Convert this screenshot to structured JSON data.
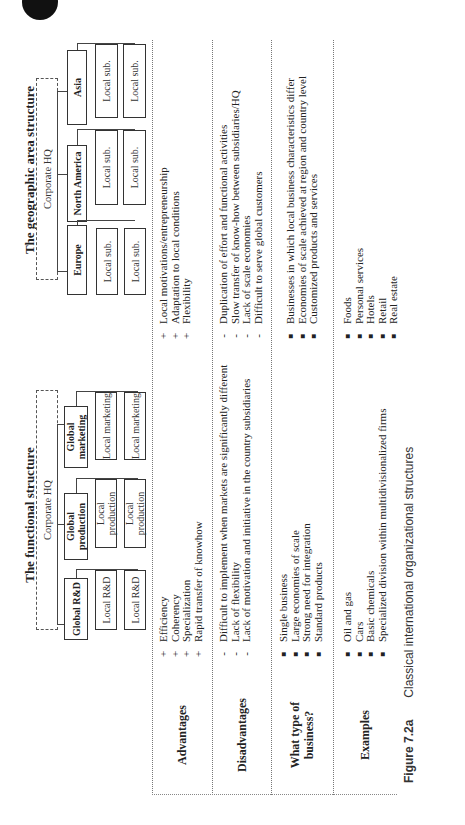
{
  "functional": {
    "title": "The functional structure",
    "hq": "Corporate HQ",
    "global_units": [
      "Global R&D",
      "Global production",
      "Global marketing"
    ],
    "local_units": [
      [
        "Local R&D",
        "Local R&D"
      ],
      [
        "Local production",
        "Local production"
      ],
      [
        "Local marketing",
        "Local marketing"
      ]
    ]
  },
  "geographic": {
    "title": "The geographic area structure",
    "hq": "Corporate HQ",
    "regions": [
      "Europe",
      "North America",
      "Asia"
    ],
    "local_units": [
      [
        "Local sub.",
        "Local sub."
      ],
      [
        "Local sub.",
        "Local sub."
      ],
      [
        "Local sub.",
        "Local sub."
      ]
    ]
  },
  "rows": {
    "advantages": {
      "label": "Advantages",
      "functional": [
        {
          "mark": "+",
          "text": "Efficiency"
        },
        {
          "mark": "+",
          "text": "Coherency"
        },
        {
          "mark": "+",
          "text": "Specialization"
        },
        {
          "mark": "+",
          "text": "Rapid transfer of knowhow"
        }
      ],
      "geographic": [
        {
          "mark": "+",
          "text": "Local motivations/entrepreneurship"
        },
        {
          "mark": "+",
          "text": "Adaptation to local conditions"
        },
        {
          "mark": "+",
          "text": "Flexibility"
        }
      ]
    },
    "disadvantages": {
      "label": "Disadvantages",
      "functional": [
        {
          "mark": "-",
          "text": "Difficult to implement when markets are significantly different"
        },
        {
          "mark": "-",
          "text": "Lack of flexibility"
        },
        {
          "mark": "-",
          "text": "Lack of motivation and initiative in the country subsidiaries"
        }
      ],
      "geographic": [
        {
          "mark": "-",
          "text": "Duplication of effort and functional activities"
        },
        {
          "mark": "-",
          "text": "Slow transfer of know-how between subsidiaries/HQ"
        },
        {
          "mark": "-",
          "text": "Lack of scale economies"
        },
        {
          "mark": "-",
          "text": "Difficult to serve global customers"
        }
      ]
    },
    "business_type": {
      "label_line1": "What type of",
      "label_line2": "business?",
      "functional": [
        {
          "mark": "■",
          "text": "Single business"
        },
        {
          "mark": "■",
          "text": "Large economies of scale"
        },
        {
          "mark": "■",
          "text": "Strong need for integration"
        },
        {
          "mark": "■",
          "text": "Standard products"
        }
      ],
      "geographic": [
        {
          "mark": "■",
          "text": "Businesses in which local business characteristics differ"
        },
        {
          "mark": "■",
          "text": "Economies of scale achieved at region and country level"
        },
        {
          "mark": "■",
          "text": "Customized products and services"
        }
      ]
    },
    "examples": {
      "label": "Examples",
      "functional": [
        {
          "mark": "■",
          "text": "Oil and gas"
        },
        {
          "mark": "■",
          "text": "Cars"
        },
        {
          "mark": "■",
          "text": "Basic chemicals"
        },
        {
          "mark": "■",
          "text": "Specialized division within multidivisionalized firms"
        }
      ],
      "geographic": [
        {
          "mark": "■",
          "text": "Foods"
        },
        {
          "mark": "■",
          "text": "Personal services"
        },
        {
          "mark": "■",
          "text": "Hotels"
        },
        {
          "mark": "■",
          "text": "Retail"
        },
        {
          "mark": "■",
          "text": "Real estate"
        }
      ]
    }
  },
  "caption": {
    "figure": "Figure 7.2a",
    "text": "Classical international organizational structures"
  }
}
